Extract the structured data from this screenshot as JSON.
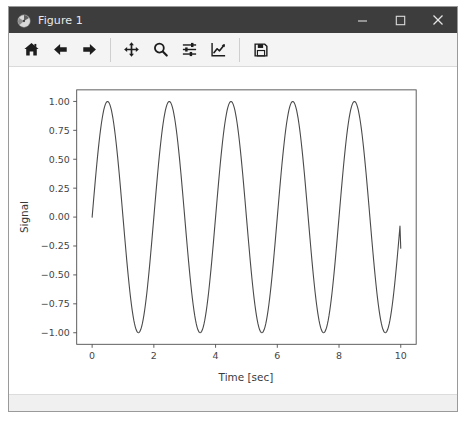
{
  "window": {
    "title": "Figure 1",
    "icon": "matplotlib-logo-icon",
    "controls": [
      {
        "name": "minimize-button",
        "glyph": "minimize-icon"
      },
      {
        "name": "maximize-button",
        "glyph": "maximize-icon"
      },
      {
        "name": "close-button",
        "glyph": "close-icon"
      }
    ]
  },
  "toolbar": {
    "buttons": [
      {
        "name": "home-button",
        "icon": "home-icon",
        "tooltip": "Reset original view"
      },
      {
        "name": "back-button",
        "icon": "arrow-left-icon",
        "tooltip": "Back to previous view"
      },
      {
        "name": "forward-button",
        "icon": "arrow-right-icon",
        "tooltip": "Forward to next view"
      },
      {
        "name": "pan-button",
        "icon": "move-arrows-icon",
        "tooltip": "Pan axes with left mouse, zoom with right"
      },
      {
        "name": "zoom-button",
        "icon": "magnifier-icon",
        "tooltip": "Zoom to rectangle"
      },
      {
        "name": "subplots-button",
        "icon": "sliders-icon",
        "tooltip": "Configure subplots"
      },
      {
        "name": "customize-button",
        "icon": "line-chart-icon",
        "tooltip": "Edit axis, curve and image parameters"
      },
      {
        "name": "save-button",
        "icon": "floppy-disk-icon",
        "tooltip": "Save the figure"
      }
    ],
    "separator_after": [
      2,
      6
    ]
  },
  "statusbar": {
    "message": ""
  },
  "chart_data": {
    "type": "line",
    "title": "",
    "xlabel": "Time [sec]",
    "ylabel": "Signal",
    "xlim": [
      -0.5,
      10.5
    ],
    "ylim": [
      -1.1,
      1.1
    ],
    "xticks": [
      0,
      2,
      4,
      6,
      8,
      10
    ],
    "xticklabels": [
      "0",
      "2",
      "4",
      "6",
      "8",
      "10"
    ],
    "yticks": [
      1.0,
      0.75,
      0.5,
      0.25,
      0.0,
      -0.25,
      -0.5,
      -0.75,
      -1.0
    ],
    "yticklabels": [
      "1.00",
      "0.75",
      "0.50",
      "0.25",
      "0.00",
      "−0.25",
      "−0.50",
      "−0.75",
      "−1.00"
    ],
    "grid": false,
    "legend": null,
    "line_color": "#4a4a4a",
    "line_width": 1.1,
    "series": [
      {
        "name": "signal",
        "function": "sin(2*pi*0.5*t)",
        "frequency_hz": 0.5,
        "amplitude": 1.0,
        "x_start": 0,
        "x_end": 10,
        "samples": 400,
        "peaks_x": [
          0.5,
          2.5,
          4.5,
          6.5,
          8.5
        ],
        "peaks_y": [
          1.0,
          1.0,
          1.0,
          1.0,
          1.0
        ],
        "troughs_x": [
          1.5,
          3.5,
          5.5,
          7.5,
          9.5
        ],
        "troughs_y": [
          -1.0,
          -1.0,
          -1.0,
          -1.0,
          -1.0
        ],
        "x": [
          0,
          0.25,
          0.5,
          0.75,
          1,
          1.25,
          1.5,
          1.75,
          2,
          2.25,
          2.5,
          2.75,
          3,
          3.25,
          3.5,
          3.75,
          4,
          4.25,
          4.5,
          4.75,
          5,
          5.25,
          5.5,
          5.75,
          6,
          6.25,
          6.5,
          6.75,
          7,
          7.25,
          7.5,
          7.75,
          8,
          8.25,
          8.5,
          8.75,
          9,
          9.25,
          9.5,
          9.75,
          10
        ],
        "y": [
          0,
          0.707,
          1,
          0.707,
          0,
          -0.707,
          -1,
          -0.707,
          0,
          0.707,
          1,
          0.707,
          0,
          -0.707,
          -1,
          -0.707,
          0,
          0.707,
          1,
          0.707,
          0,
          -0.707,
          -1,
          -0.707,
          0,
          0.707,
          1,
          0.707,
          0,
          -0.707,
          -1,
          -0.707,
          0,
          0.707,
          1,
          0.707,
          0,
          -0.707,
          -1,
          -0.707,
          -0.27
        ]
      }
    ]
  }
}
